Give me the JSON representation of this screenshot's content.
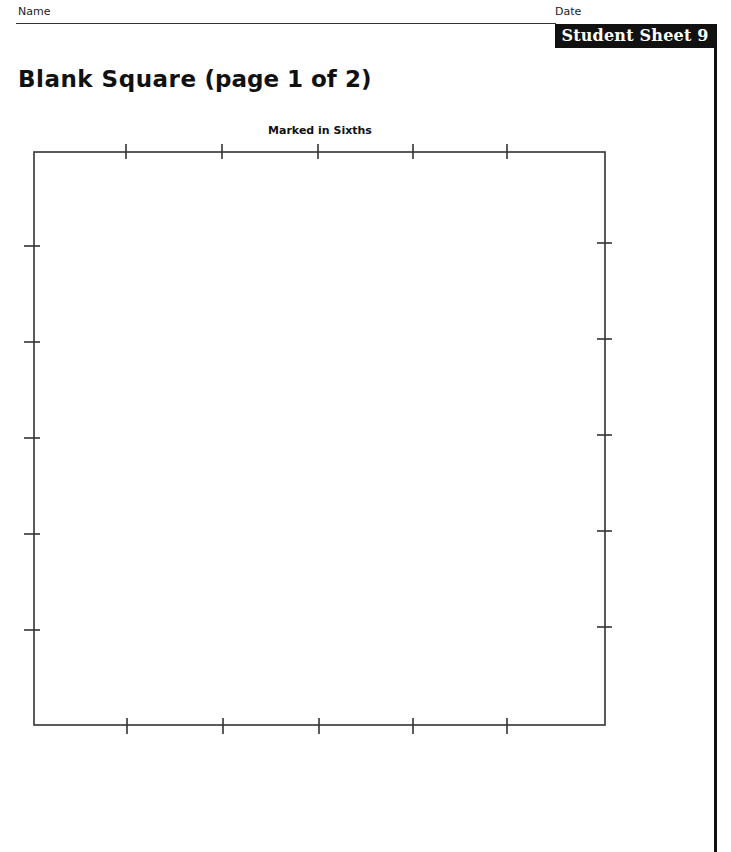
{
  "header": {
    "name_label": "Name",
    "date_label": "Date",
    "sheet_label": "Student Sheet 9"
  },
  "title": {
    "bold_part": "Blank Square",
    "normal_part": " (page 1 of 2)"
  },
  "square": {
    "caption": "Marked in Sixths",
    "divisions": 6,
    "bounds": {
      "left": 34,
      "top": 152,
      "right": 605,
      "bottom": 725
    },
    "top_ticks_x": [
      126,
      222,
      318,
      413,
      507
    ],
    "bottom_ticks_x": [
      127,
      223,
      319,
      413,
      507
    ],
    "left_ticks_y": [
      246,
      342,
      438,
      534,
      630
    ],
    "right_ticks_y": [
      243,
      339,
      435,
      531,
      627
    ],
    "line_color": "#333333"
  }
}
